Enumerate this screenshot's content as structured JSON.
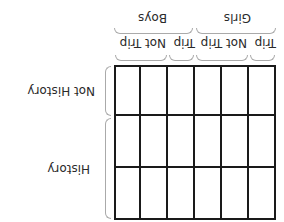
{
  "diagram": {
    "type": "two-way table template",
    "orientation": "rotated 180 degrees",
    "column_groups": [
      {
        "label": "Girls",
        "subcolumns": [
          {
            "label": "Trip",
            "span": 1
          },
          {
            "label": "Not Trip",
            "span": 2
          }
        ]
      },
      {
        "label": "Boys",
        "subcolumns": [
          {
            "label": "Trip",
            "span": 1
          },
          {
            "label": "Not Trip",
            "span": 2
          }
        ]
      }
    ],
    "row_groups": [
      {
        "label": "History",
        "span": 2
      },
      {
        "label": "Not History",
        "span": 1
      }
    ],
    "grid": {
      "rows": 3,
      "columns": 6,
      "cells_empty": true
    },
    "line_color": "#1a1a1a",
    "brace_color": "#aaaaaa"
  }
}
